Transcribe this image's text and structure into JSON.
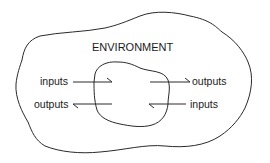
{
  "diagram": {
    "environment_label": "ENVIRONMENT",
    "left": {
      "top_label": "inputs",
      "bottom_label": "outputs"
    },
    "right": {
      "top_label": "outputs",
      "bottom_label": "inputs"
    },
    "stroke_color": "#2a2a2a"
  }
}
